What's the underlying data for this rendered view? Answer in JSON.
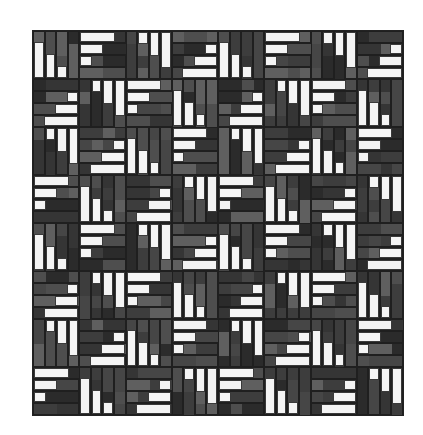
{
  "image": {
    "description": "Log-cabin style quilt pattern of grayscale strips with white staircase bars",
    "background": "#ffffff"
  },
  "quilt": {
    "rows": 8,
    "cols": 8,
    "strips_per_block": 4,
    "colors": {
      "white": "#f4f4f4",
      "grays": [
        "#2b2b2b",
        "#3d3d3d",
        "#4e4e4e",
        "#5f5f5f",
        "#353535",
        "#464646"
      ]
    },
    "block_types": {
      "A": {
        "orientation": "vertical",
        "anchor": "bottom",
        "white_strips": [
          0,
          1,
          2
        ],
        "lengths": [
          3,
          2,
          1
        ]
      },
      "B": {
        "orientation": "horizontal",
        "anchor": "left",
        "white_strips": [
          0,
          1,
          2
        ],
        "lengths": [
          3,
          2,
          1
        ]
      },
      "C": {
        "orientation": "vertical",
        "anchor": "top",
        "white_strips": [
          1,
          2,
          3
        ],
        "lengths": [
          1,
          2,
          3
        ]
      },
      "D": {
        "orientation": "horizontal",
        "anchor": "right",
        "white_strips": [
          1,
          2,
          3
        ],
        "lengths": [
          1,
          2,
          3
        ]
      }
    },
    "layout": [
      [
        "A",
        "B",
        "C",
        "D",
        "A",
        "B",
        "C",
        "D"
      ],
      [
        "D",
        "C",
        "B",
        "A",
        "D",
        "C",
        "B",
        "A"
      ],
      [
        "C",
        "D",
        "A",
        "B",
        "C",
        "D",
        "A",
        "B"
      ],
      [
        "B",
        "A",
        "D",
        "C",
        "B",
        "A",
        "D",
        "C"
      ],
      [
        "A",
        "B",
        "C",
        "D",
        "A",
        "B",
        "C",
        "D"
      ],
      [
        "D",
        "C",
        "B",
        "A",
        "D",
        "C",
        "B",
        "A"
      ],
      [
        "C",
        "D",
        "A",
        "B",
        "C",
        "D",
        "A",
        "B"
      ],
      [
        "B",
        "A",
        "D",
        "C",
        "B",
        "A",
        "D",
        "C"
      ]
    ]
  }
}
